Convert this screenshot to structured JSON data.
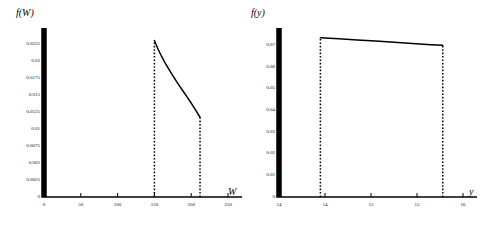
{
  "figure": {
    "background": "#ffffff",
    "ink": "#000000",
    "panel_count": 2
  },
  "chart_data": [
    {
      "id": "left",
      "type": "line",
      "title": "",
      "xlabel": "W",
      "ylabel": "f(W)",
      "xlim": [
        0,
        250
      ],
      "ylim": [
        0,
        0.025
      ],
      "grid": false,
      "legend": null,
      "xticks": [
        "0",
        "50",
        "100",
        "150",
        "200",
        "250"
      ],
      "xtick_values": [
        0,
        50,
        100,
        150,
        200,
        250
      ],
      "yticks": [
        "0",
        "0.0025",
        "0.005",
        "0.0075",
        "0.01",
        "0.0125",
        "0.015",
        "0.0175",
        "0.02",
        "0.0225"
      ],
      "ytick_values": [
        0,
        0.0025,
        0.005,
        0.0075,
        0.01,
        0.0125,
        0.015,
        0.0175,
        0.02,
        0.0225
      ],
      "support": [
        150,
        212
      ],
      "series": [
        {
          "name": "f(W)",
          "style": "solid",
          "x": [
            150,
            155,
            160,
            165,
            170,
            175,
            180,
            185,
            190,
            195,
            200,
            205,
            210,
            212
          ],
          "values": [
            0.02315,
            0.02185,
            0.02075,
            0.01975,
            0.01885,
            0.01795,
            0.0171,
            0.0163,
            0.0155,
            0.0147,
            0.0139,
            0.01305,
            0.01215,
            0.0118
          ]
        }
      ],
      "boundaries": [
        {
          "name": "left-boundary",
          "x": 150,
          "style": "dotted",
          "y_top": 0.02315
        },
        {
          "name": "right-boundary",
          "x": 212,
          "style": "dotted",
          "y_top": 0.0118
        }
      ]
    },
    {
      "id": "right",
      "type": "line",
      "title": "",
      "xlabel": "y",
      "ylabel": "f(y)",
      "xlim": [
        14,
        16
      ],
      "ylim": [
        0,
        0.078
      ],
      "grid": false,
      "legend": null,
      "xticks": [
        "14",
        "14",
        "15",
        "15",
        "16"
      ],
      "xtick_values": [
        14,
        14.5,
        15,
        15.5,
        16
      ],
      "yticks": [
        "0",
        "0.01",
        "0.02",
        "0.03",
        "0.04",
        "0.05",
        "0.06",
        "0.07"
      ],
      "ytick_values": [
        0,
        0.01,
        0.02,
        0.03,
        0.04,
        0.05,
        0.06,
        0.07
      ],
      "support": [
        14.45,
        15.78
      ],
      "series": [
        {
          "name": "f(y)",
          "style": "solid",
          "x": [
            14.45,
            14.65,
            14.85,
            15.05,
            15.25,
            15.45,
            15.65,
            15.78
          ],
          "values": [
            0.0735,
            0.073,
            0.0725,
            0.072,
            0.0714,
            0.0709,
            0.0703,
            0.07
          ]
        }
      ],
      "boundaries": [
        {
          "name": "left-boundary",
          "x": 14.45,
          "style": "dotted",
          "y_top": 0.0735
        },
        {
          "name": "right-boundary",
          "x": 15.78,
          "style": "dotted",
          "y_top": 0.07
        }
      ]
    }
  ]
}
